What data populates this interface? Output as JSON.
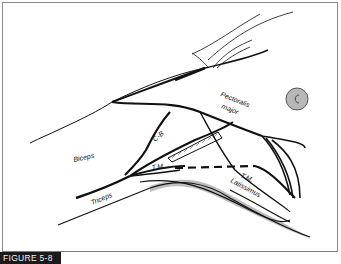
{
  "figure": {
    "caption": "FIGURE 5-8",
    "labels": {
      "pectoralis_major_1": "Pectoralis",
      "pectoralis_major_2": "major",
      "biceps": "Biceps",
      "triceps": "Triceps",
      "coracobrachialis": "C-B",
      "teres_major_left": "T.M.",
      "teres_major_right": "T.M.",
      "latissimus": "Latissimus"
    },
    "colors": {
      "line": "#111111",
      "shadow": "#bdbdbd",
      "nipple_fill": "#b8b8b8",
      "caption_bg": "#1a1a1a",
      "caption_text": "#f0f0f0"
    }
  }
}
